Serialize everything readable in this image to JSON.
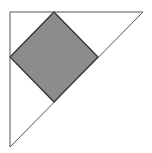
{
  "diagram": {
    "canvas": {
      "width": 152,
      "height": 153,
      "background": "#ffffff"
    },
    "triangle": {
      "points": [
        [
          10,
          12
        ],
        [
          143,
          12
        ],
        [
          10,
          147
        ]
      ],
      "fill": "none",
      "stroke": "#555555",
      "stroke_width": 1
    },
    "square": {
      "points": [
        [
          54,
          12
        ],
        [
          98,
          57
        ],
        [
          54,
          102
        ],
        [
          10,
          57
        ]
      ],
      "fill": "#8c8c8c",
      "stroke": "#333333",
      "stroke_width": 1.3
    }
  }
}
